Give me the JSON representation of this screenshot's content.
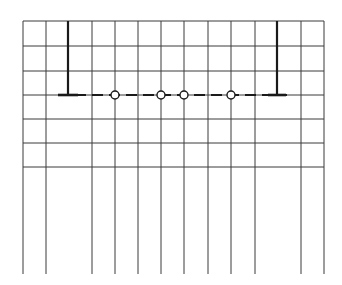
{
  "diagram": {
    "type": "grid-with-supported-line",
    "colors": {
      "background": "#ffffff",
      "grid": "#3a3a3a",
      "line": "#1a1a1a",
      "node_fill": "#ffffff"
    },
    "grid": {
      "left": 23,
      "right": 324,
      "top": 21,
      "grid_bottom": 167,
      "lines_bottom": 274,
      "columns_x": [
        23,
        46,
        68,
        92,
        115,
        138,
        161,
        184,
        208,
        231,
        255,
        278,
        301,
        324
      ],
      "rows_y": [
        21,
        46,
        71,
        95,
        119,
        143,
        167
      ],
      "full_length_columns_x": [
        23,
        46,
        92,
        115,
        138,
        161,
        184,
        208,
        231,
        255,
        301,
        324
      ],
      "short_columns_x": [
        68,
        278
      ],
      "short_columns_end_y": 95
    },
    "dashed_line": {
      "y": 95,
      "x_start": 58,
      "x_end": 287,
      "dash": 11,
      "gap": 6
    },
    "supports": [
      {
        "name": "left-support",
        "x": 68,
        "top_y": 21,
        "foot_y": 95,
        "foot_half_width": 10
      },
      {
        "name": "right-support",
        "x": 277,
        "top_y": 21,
        "foot_y": 95,
        "foot_half_width": 9
      }
    ],
    "nodes": [
      {
        "name": "node-1",
        "x": 115,
        "y": 95,
        "r": 4
      },
      {
        "name": "node-2",
        "x": 161,
        "y": 95,
        "r": 4
      },
      {
        "name": "node-3",
        "x": 184,
        "y": 95,
        "r": 4
      },
      {
        "name": "node-4",
        "x": 231,
        "y": 95,
        "r": 4
      }
    ]
  }
}
